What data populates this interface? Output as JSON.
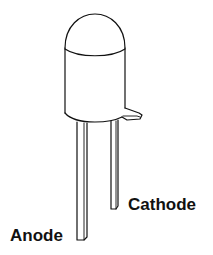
{
  "figure": {
    "colors": {
      "stroke": "#111111",
      "background": "#ffffff"
    },
    "labels": {
      "cathode": "Cathode",
      "anode": "Anode"
    }
  }
}
